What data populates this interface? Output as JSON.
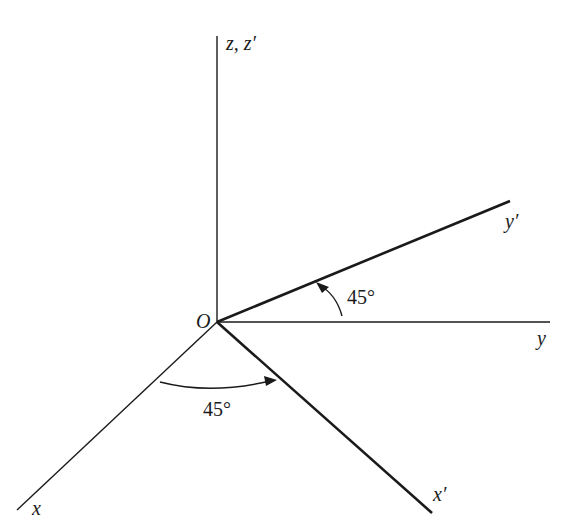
{
  "diagram": {
    "origin_label": "O",
    "axes": {
      "z": {
        "label": "z, z′"
      },
      "y": {
        "label": "y"
      },
      "y_prime": {
        "label": "y′"
      },
      "x": {
        "label": "x"
      },
      "x_prime": {
        "label": "x′"
      }
    },
    "angles": {
      "upper": {
        "label": "45°",
        "from": "y",
        "to": "y′"
      },
      "lower": {
        "label": "45°",
        "from": "x",
        "to": "x′"
      }
    },
    "colors": {
      "ink": "#1a1a1a",
      "background": "#ffffff"
    }
  }
}
